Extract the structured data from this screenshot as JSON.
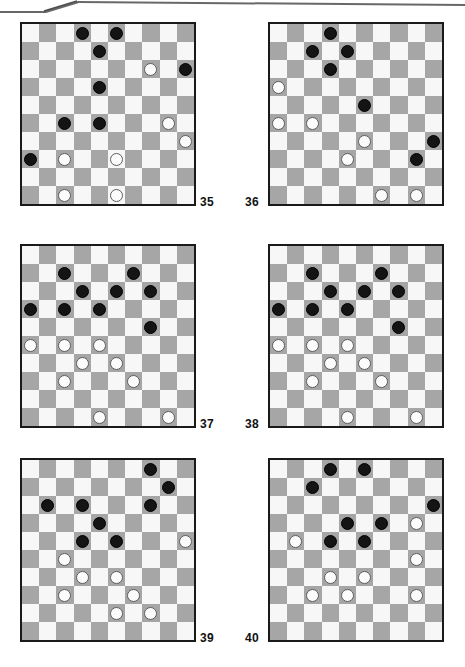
{
  "page": {
    "kind": "draughts-puzzle-sheet",
    "board_size": 10,
    "colors": {
      "dark_square": "#a6a6a6",
      "light_square": "#f7f7f7",
      "black_piece": "#141414",
      "white_piece": "#fcfcfc",
      "board_border": "#1a1a1a",
      "page_background": "#ffffff",
      "label_text": "#111111"
    }
  },
  "boards": [
    {
      "number": "35",
      "number_side": "right",
      "black": [
        [
          0,
          3
        ],
        [
          0,
          5
        ],
        [
          1,
          4
        ],
        [
          2,
          9
        ],
        [
          3,
          4
        ],
        [
          5,
          2
        ],
        [
          5,
          4
        ],
        [
          7,
          0
        ]
      ],
      "white": [
        [
          2,
          7
        ],
        [
          5,
          8
        ],
        [
          6,
          9
        ],
        [
          7,
          2
        ],
        [
          7,
          5
        ],
        [
          9,
          2
        ],
        [
          9,
          5
        ]
      ],
      "counts": {
        "black": 8,
        "white": 7
      }
    },
    {
      "number": "36",
      "number_side": "left",
      "black": [
        [
          0,
          3
        ],
        [
          1,
          2
        ],
        [
          1,
          4
        ],
        [
          2,
          3
        ],
        [
          4,
          5
        ],
        [
          6,
          9
        ],
        [
          7,
          8
        ]
      ],
      "white": [
        [
          3,
          0
        ],
        [
          5,
          0
        ],
        [
          5,
          2
        ],
        [
          6,
          5
        ],
        [
          7,
          4
        ],
        [
          9,
          6
        ],
        [
          9,
          8
        ]
      ],
      "counts": {
        "black": 7,
        "white": 7
      }
    },
    {
      "number": "37",
      "number_side": "right",
      "black": [
        [
          1,
          2
        ],
        [
          1,
          6
        ],
        [
          2,
          3
        ],
        [
          2,
          5
        ],
        [
          2,
          7
        ],
        [
          3,
          0
        ],
        [
          3,
          2
        ],
        [
          3,
          4
        ],
        [
          4,
          7
        ]
      ],
      "white": [
        [
          5,
          0
        ],
        [
          5,
          2
        ],
        [
          5,
          4
        ],
        [
          6,
          3
        ],
        [
          6,
          5
        ],
        [
          7,
          2
        ],
        [
          7,
          6
        ],
        [
          9,
          4
        ],
        [
          9,
          8
        ]
      ],
      "counts": {
        "black": 9,
        "white": 9
      }
    },
    {
      "number": "38",
      "number_side": "left",
      "black": [
        [
          1,
          2
        ],
        [
          1,
          6
        ],
        [
          2,
          3
        ],
        [
          2,
          5
        ],
        [
          2,
          7
        ],
        [
          3,
          0
        ],
        [
          3,
          2
        ],
        [
          3,
          4
        ],
        [
          4,
          7
        ]
      ],
      "white": [
        [
          5,
          0
        ],
        [
          5,
          2
        ],
        [
          5,
          4
        ],
        [
          6,
          3
        ],
        [
          6,
          5
        ],
        [
          7,
          2
        ],
        [
          7,
          6
        ],
        [
          9,
          4
        ],
        [
          9,
          8
        ]
      ],
      "counts": {
        "black": 9,
        "white": 9
      }
    },
    {
      "number": "39",
      "number_side": "right",
      "black": [
        [
          0,
          7
        ],
        [
          1,
          8
        ],
        [
          2,
          1
        ],
        [
          2,
          3
        ],
        [
          2,
          7
        ],
        [
          3,
          4
        ],
        [
          4,
          3
        ],
        [
          4,
          5
        ]
      ],
      "white": [
        [
          4,
          9
        ],
        [
          5,
          2
        ],
        [
          6,
          3
        ],
        [
          6,
          5
        ],
        [
          7,
          2
        ],
        [
          7,
          6
        ],
        [
          8,
          5
        ],
        [
          8,
          7
        ]
      ],
      "counts": {
        "black": 8,
        "white": 8
      }
    },
    {
      "number": "40",
      "number_side": "left",
      "black": [
        [
          0,
          3
        ],
        [
          0,
          5
        ],
        [
          1,
          2
        ],
        [
          2,
          9
        ],
        [
          3,
          4
        ],
        [
          3,
          6
        ],
        [
          4,
          3
        ],
        [
          4,
          5
        ]
      ],
      "white": [
        [
          3,
          8
        ],
        [
          4,
          1
        ],
        [
          5,
          8
        ],
        [
          6,
          3
        ],
        [
          6,
          5
        ],
        [
          7,
          2
        ],
        [
          7,
          4
        ],
        [
          7,
          8
        ]
      ],
      "counts": {
        "black": 8,
        "white": 8
      }
    }
  ],
  "layout": {
    "rows": [
      {
        "top": 22
      },
      {
        "top": 244
      },
      {
        "top": 458
      }
    ],
    "columns": [
      {
        "left": 20
      },
      {
        "left": 268
      }
    ],
    "number_positions": [
      {
        "number": "35",
        "x": 200,
        "y": 196
      },
      {
        "number": "36",
        "x": 245,
        "y": 196
      },
      {
        "number": "37",
        "x": 200,
        "y": 418
      },
      {
        "number": "38",
        "x": 245,
        "y": 418
      },
      {
        "number": "39",
        "x": 200,
        "y": 632
      },
      {
        "number": "40",
        "x": 245,
        "y": 632
      }
    ]
  }
}
